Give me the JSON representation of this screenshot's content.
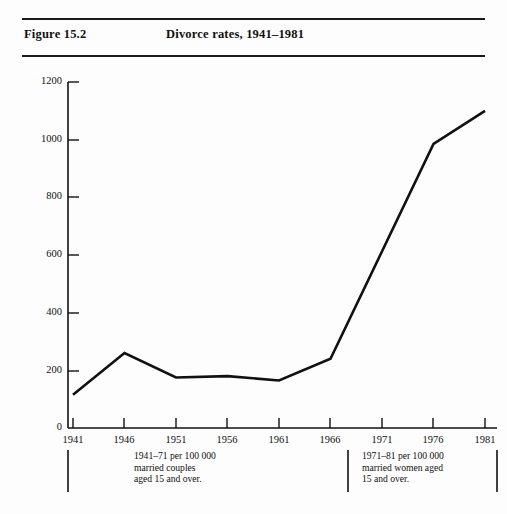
{
  "figure": {
    "label": "Figure 15.2",
    "title": "Divorce rates, 1941–1981"
  },
  "chart_data": {
    "type": "line",
    "title": "Divorce rates, 1941–1981",
    "xlabel": "",
    "ylabel": "",
    "categories": [
      "1941",
      "1946",
      "1951",
      "1956",
      "1961",
      "1966",
      "1971",
      "1976",
      "1981"
    ],
    "x": [
      1941,
      1946,
      1951,
      1956,
      1961,
      1966,
      1971,
      1976,
      1981
    ],
    "values": [
      115,
      260,
      175,
      180,
      165,
      240,
      530,
      985,
      1100
    ],
    "vertices": [
      1941,
      1946,
      1951,
      1956,
      1961,
      1966,
      1976,
      1981
    ],
    "ylim": [
      0,
      1200
    ],
    "yticks": [
      0,
      200,
      400,
      600,
      800,
      1000,
      1200
    ],
    "xticks": [
      "1941",
      "1946",
      "1951",
      "1956",
      "1961",
      "1966",
      "1971",
      "1976",
      "1981"
    ],
    "grid": false,
    "legend": null,
    "line_color": "#111111",
    "annotations": [
      "1941–71 per 100 000 married couples aged 15 and over.",
      "1971–81 per 100 000 married women aged 15 and over."
    ]
  },
  "axis": {
    "y_labels": [
      "1200",
      "1000",
      "800",
      "600",
      "400",
      "200",
      "0"
    ],
    "x_labels": [
      "1941",
      "1946",
      "1951",
      "1956",
      "1961",
      "1966",
      "1971",
      "1976",
      "1981"
    ]
  },
  "footnotes": {
    "left": {
      "line1": "1941–71 per 100 000",
      "line2": "married couples",
      "line3": "aged 15 and over."
    },
    "right": {
      "line1": "1971–81 per 100 000",
      "line2": "married women aged",
      "line3": "15 and over."
    }
  }
}
